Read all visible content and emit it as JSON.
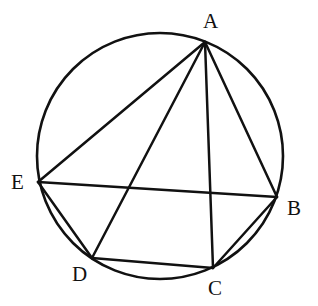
{
  "figure": {
    "background_color": "#ffffff",
    "stroke_color": "#111111",
    "label_color": "#111111"
  },
  "circle": {
    "name": "circumscribed-circle",
    "center_x": 160,
    "center_y": 156,
    "radius": 123,
    "stroke_width": 2.6
  },
  "points": [
    {
      "id": "A",
      "label": "A",
      "x": 205,
      "y": 42,
      "label_x": 203,
      "label_y": 11
    },
    {
      "id": "B",
      "label": "B",
      "x": 277,
      "y": 197,
      "label_x": 287,
      "label_y": 198
    },
    {
      "id": "C",
      "label": "C",
      "x": 213,
      "y": 268,
      "label_x": 208,
      "label_y": 278
    },
    {
      "id": "D",
      "label": "D",
      "x": 92,
      "y": 258,
      "label_x": 72,
      "label_y": 264
    },
    {
      "id": "E",
      "label": "E",
      "x": 38,
      "y": 182,
      "label_x": 11,
      "label_y": 172
    }
  ],
  "chords": [
    {
      "id": "AE",
      "from": "A",
      "to": "E",
      "x1": 205,
      "y1": 42,
      "x2": 38,
      "y2": 182
    },
    {
      "id": "AD",
      "from": "A",
      "to": "D",
      "x1": 205,
      "y1": 42,
      "x2": 92,
      "y2": 258
    },
    {
      "id": "AC",
      "from": "A",
      "to": "C",
      "x1": 205,
      "y1": 42,
      "x2": 213,
      "y2": 268
    },
    {
      "id": "AB",
      "from": "A",
      "to": "B",
      "x1": 205,
      "y1": 42,
      "x2": 277,
      "y2": 197
    },
    {
      "id": "EB",
      "from": "E",
      "to": "B",
      "x1": 38,
      "y1": 182,
      "x2": 277,
      "y2": 197
    },
    {
      "id": "ED",
      "from": "E",
      "to": "D",
      "x1": 38,
      "y1": 182,
      "x2": 92,
      "y2": 258
    },
    {
      "id": "DC",
      "from": "D",
      "to": "C",
      "x1": 92,
      "y1": 258,
      "x2": 213,
      "y2": 268
    },
    {
      "id": "CB",
      "from": "C",
      "to": "B",
      "x1": 213,
      "y1": 268,
      "x2": 277,
      "y2": 197
    }
  ],
  "chart_data": {
    "type": "diagram",
    "shape": "circle-with-inscribed-chords",
    "circle": {
      "cx": 160,
      "cy": 156,
      "r": 123
    },
    "vertices": [
      {
        "label": "A",
        "x": 205,
        "y": 42
      },
      {
        "label": "B",
        "x": 277,
        "y": 197
      },
      {
        "label": "C",
        "x": 213,
        "y": 268
      },
      {
        "label": "D",
        "x": 92,
        "y": 258
      },
      {
        "label": "E",
        "x": 38,
        "y": 182
      }
    ],
    "edges": [
      "AE",
      "AD",
      "AC",
      "AB",
      "EB",
      "ED",
      "DC",
      "CB"
    ]
  }
}
